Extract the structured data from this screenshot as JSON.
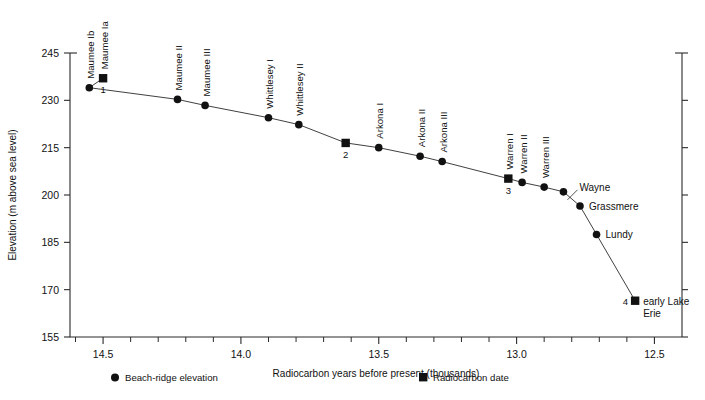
{
  "chart_data": {
    "type": "line",
    "title": "",
    "xlabel": "Radiocarbon years before present (thousands)",
    "ylabel": "Elevation (m above sea level)",
    "xlim": [
      14.62,
      12.4
    ],
    "ylim": [
      155,
      245
    ],
    "x_reversed": true,
    "grid": false,
    "x_ticks": [
      14.5,
      14.0,
      13.5,
      13.0,
      12.5
    ],
    "x_tick_labels": [
      "14.5",
      "14.0",
      "13.5",
      "13.0",
      "12.5"
    ],
    "x_minor_step": 0.1,
    "y_ticks": [
      155,
      170,
      185,
      200,
      215,
      230,
      245
    ],
    "y_tick_labels": [
      "155",
      "170",
      "185",
      "200",
      "215",
      "230",
      "245"
    ],
    "legend_position": "below-axis",
    "legend": [
      {
        "marker": "circle",
        "label": "Beach-ridge elevation"
      },
      {
        "marker": "square",
        "label": "Radiocarbon date"
      }
    ],
    "series": [
      {
        "name": "Beach-ridge elevation profile",
        "points": [
          {
            "x": 14.5,
            "y": 237.0,
            "label": "Maumee Ia",
            "marker": "square",
            "label_orient": "vertical",
            "date_number": "1"
          },
          {
            "x": 14.55,
            "y": 234.0,
            "label": "Maumee Ib",
            "marker": "circle",
            "label_orient": "vertical",
            "date_number": ""
          },
          {
            "x": 14.23,
            "y": 230.3,
            "label": "Maumee II",
            "marker": "circle",
            "label_orient": "vertical",
            "date_number": ""
          },
          {
            "x": 14.13,
            "y": 228.4,
            "label": "Maumee III",
            "marker": "circle",
            "label_orient": "vertical",
            "date_number": ""
          },
          {
            "x": 13.9,
            "y": 224.5,
            "label": "Whittlesey I",
            "marker": "circle",
            "label_orient": "vertical",
            "date_number": ""
          },
          {
            "x": 13.79,
            "y": 222.3,
            "label": "Whittlesey II",
            "marker": "circle",
            "label_orient": "vertical",
            "date_number": ""
          },
          {
            "x": 13.62,
            "y": 216.5,
            "label": "",
            "marker": "square",
            "label_orient": "none",
            "date_number": "2"
          },
          {
            "x": 13.5,
            "y": 215.0,
            "label": "Arkona I",
            "marker": "circle",
            "label_orient": "vertical",
            "date_number": ""
          },
          {
            "x": 13.35,
            "y": 212.3,
            "label": "Arkona II",
            "marker": "circle",
            "label_orient": "vertical",
            "date_number": ""
          },
          {
            "x": 13.27,
            "y": 210.6,
            "label": "Arkona III",
            "marker": "circle",
            "label_orient": "vertical",
            "date_number": ""
          },
          {
            "x": 13.03,
            "y": 205.2,
            "label": "Warren I",
            "marker": "square",
            "label_orient": "vertical",
            "date_number": "3"
          },
          {
            "x": 12.98,
            "y": 204.0,
            "label": "Warren II",
            "marker": "circle",
            "label_orient": "vertical",
            "date_number": ""
          },
          {
            "x": 12.9,
            "y": 202.5,
            "label": "Warren III",
            "marker": "circle",
            "label_orient": "vertical",
            "date_number": ""
          },
          {
            "x": 12.83,
            "y": 201.0,
            "label": "Wayne",
            "marker": "circle",
            "label_orient": "horizontal",
            "date_number": ""
          },
          {
            "x": 12.77,
            "y": 196.5,
            "label": "Grassmere",
            "marker": "circle",
            "label_orient": "horizontal",
            "date_number": ""
          },
          {
            "x": 12.71,
            "y": 187.5,
            "label": "Lundy",
            "marker": "circle",
            "label_orient": "horizontal",
            "date_number": ""
          },
          {
            "x": 12.57,
            "y": 166.5,
            "label": "early Lake Erie",
            "marker": "square",
            "label_orient": "horizontal-2line",
            "date_number": "4"
          }
        ]
      }
    ],
    "annotations": [
      {
        "text": "early Lake",
        "line2": "Erie"
      }
    ]
  }
}
